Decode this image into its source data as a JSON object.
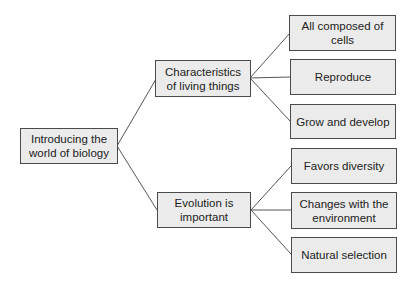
{
  "diagram": {
    "type": "tree-mind-map",
    "colors": {
      "node_fill": "#ebebeb",
      "node_border": "#4a4a4a",
      "text": "#222222",
      "connector": "#555555"
    },
    "root": {
      "label": "Introducing the world of biology"
    },
    "branches": [
      {
        "label": "Characteristics of living things",
        "children": [
          {
            "label": "All composed of cells"
          },
          {
            "label": "Reproduce"
          },
          {
            "label": "Grow and develop"
          }
        ]
      },
      {
        "label": "Evolution is important",
        "children": [
          {
            "label": "Favors diversity"
          },
          {
            "label": "Changes with the environment"
          },
          {
            "label": "Natural selection"
          }
        ]
      }
    ]
  }
}
